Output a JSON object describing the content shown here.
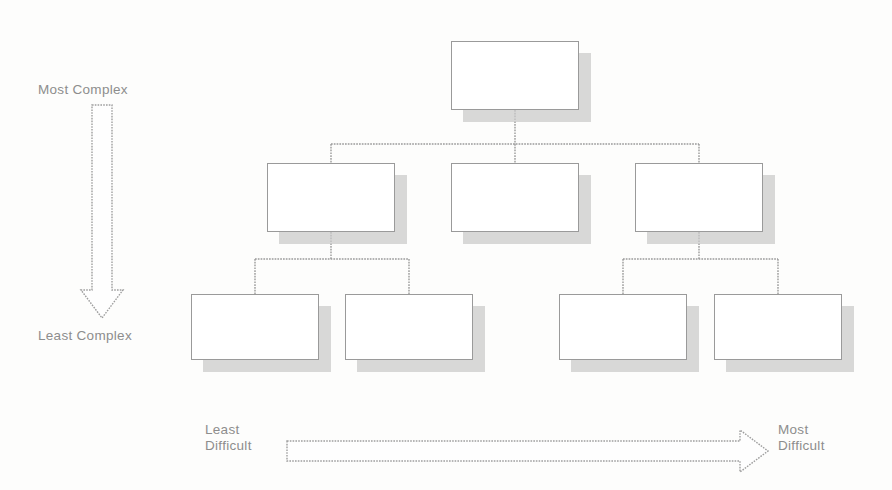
{
  "diagram": {
    "background_color": "#fdfdfc",
    "line_color": "#9a9a9a",
    "text_color": "#8d8d8d",
    "shadow_color": "#c9c9c9"
  },
  "vertical_axis": {
    "name": "complexity-axis",
    "direction": "down",
    "top_label": "Most Complex",
    "bottom_label": "Least Complex"
  },
  "horizontal_axis": {
    "name": "difficulty-axis",
    "direction": "right",
    "left_label": "Least\nDifficult",
    "right_label": "Most\nDifficult"
  },
  "tree": {
    "levels": [
      {
        "level": 1,
        "label": "root-level",
        "nodes": [
          {
            "id": "n1",
            "text": "",
            "x": 451,
            "y": 41,
            "w": 128,
            "h": 69
          }
        ]
      },
      {
        "level": 2,
        "label": "middle-level",
        "nodes": [
          {
            "id": "n2",
            "text": "",
            "x": 267,
            "y": 163,
            "w": 128,
            "h": 69
          },
          {
            "id": "n3",
            "text": "",
            "x": 451,
            "y": 163,
            "w": 128,
            "h": 69
          },
          {
            "id": "n4",
            "text": "",
            "x": 635,
            "y": 163,
            "w": 128,
            "h": 69
          }
        ]
      },
      {
        "level": 3,
        "label": "leaf-level",
        "nodes": [
          {
            "id": "n5",
            "text": "",
            "x": 191,
            "y": 294,
            "w": 128,
            "h": 66
          },
          {
            "id": "n6",
            "text": "",
            "x": 345,
            "y": 294,
            "w": 128,
            "h": 66
          },
          {
            "id": "n7",
            "text": "",
            "x": 559,
            "y": 294,
            "w": 128,
            "h": 66
          },
          {
            "id": "n8",
            "text": "",
            "x": 714,
            "y": 294,
            "w": 128,
            "h": 66
          }
        ]
      }
    ],
    "edges": [
      {
        "from": "n1",
        "to": "n2"
      },
      {
        "from": "n1",
        "to": "n3"
      },
      {
        "from": "n1",
        "to": "n4"
      },
      {
        "from": "n2",
        "to": "n5"
      },
      {
        "from": "n2",
        "to": "n6"
      },
      {
        "from": "n4",
        "to": "n7"
      },
      {
        "from": "n4",
        "to": "n8"
      }
    ]
  }
}
